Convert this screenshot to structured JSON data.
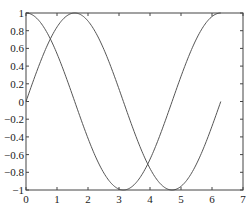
{
  "chart_data": {
    "type": "line",
    "title": "",
    "xlabel": "",
    "ylabel": "",
    "xlim": [
      0,
      7
    ],
    "ylim": [
      -1,
      1
    ],
    "grid": false,
    "legend": null,
    "x_ticks": [
      "0",
      "1",
      "2",
      "3",
      "4",
      "5",
      "6",
      "7"
    ],
    "y_ticks": [
      "1",
      "0.8",
      "0.6",
      "0.4",
      "0.2",
      "0",
      "−0.2",
      "−0.4",
      "−0.6",
      "−0.8",
      "−1"
    ],
    "series": [
      {
        "name": "sin(x)",
        "x_range": [
          0,
          6.283
        ],
        "function": "sin",
        "color": "#555555"
      },
      {
        "name": "cos(x)",
        "x_range": [
          0,
          6.283
        ],
        "function": "cos",
        "color": "#555555"
      }
    ]
  }
}
